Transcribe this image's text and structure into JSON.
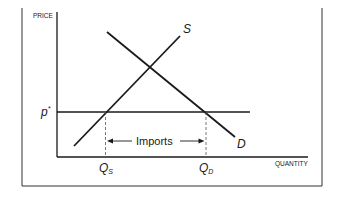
{
  "figure": {
    "y_axis_label": "PRICE",
    "x_axis_label": "QUANTITY",
    "price_label": "p",
    "price_label_sup": "*",
    "supply_label": "S",
    "demand_label": "D",
    "qs_label": "Q",
    "qs_sub": "S",
    "qd_label": "Q",
    "qd_sub": "D",
    "imports_label": "Imports"
  },
  "colors": {
    "line": "#1a1a1a",
    "dashed": "#555555",
    "frame": "#333333",
    "background": "#ffffff"
  }
}
